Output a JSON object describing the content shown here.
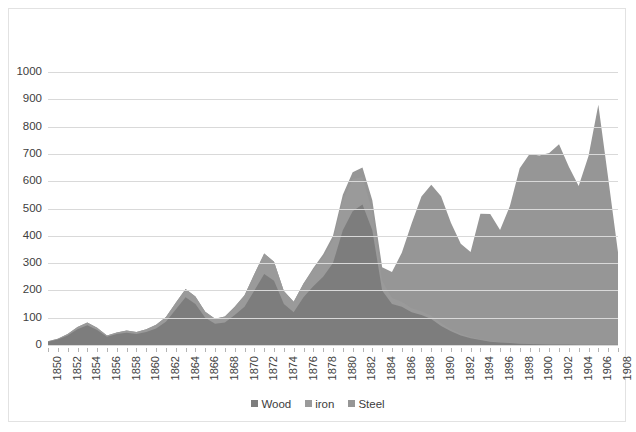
{
  "chart_data": {
    "type": "area",
    "title": "",
    "subtitle": "",
    "xlabel": "",
    "ylabel": "",
    "stacked": true,
    "grid": true,
    "legend_position": "bottom",
    "xlim": [
      1850,
      1908
    ],
    "ylim": [
      0,
      1000
    ],
    "ytick_step": 100,
    "xtick_step": 2,
    "categories": [
      1850,
      1851,
      1852,
      1853,
      1854,
      1855,
      1856,
      1857,
      1858,
      1859,
      1860,
      1861,
      1862,
      1863,
      1864,
      1865,
      1866,
      1867,
      1868,
      1869,
      1870,
      1871,
      1872,
      1873,
      1874,
      1875,
      1876,
      1877,
      1878,
      1879,
      1880,
      1881,
      1882,
      1883,
      1884,
      1885,
      1886,
      1887,
      1888,
      1889,
      1890,
      1891,
      1892,
      1893,
      1894,
      1895,
      1896,
      1897,
      1898,
      1899,
      1900,
      1901,
      1902,
      1903,
      1904,
      1905,
      1906,
      1907,
      1908
    ],
    "ytick_labels": [
      "0",
      "100",
      "200",
      "300",
      "400",
      "500",
      "600",
      "700",
      "800",
      "900",
      "1000"
    ],
    "xtick_labels": [
      "1850",
      "1852",
      "1854",
      "1856",
      "1858",
      "1860",
      "1862",
      "1864",
      "1866",
      "1868",
      "1870",
      "1872",
      "1874",
      "1876",
      "1878",
      "1880",
      "1882",
      "1884",
      "1886",
      "1888",
      "1890",
      "1892",
      "1894",
      "1896",
      "1898",
      "1900",
      "1902",
      "1904",
      "1906",
      "1908"
    ],
    "series": [
      {
        "name": "Wood",
        "color": "#7d7d7d",
        "values": [
          12,
          20,
          35,
          58,
          72,
          55,
          30,
          40,
          45,
          40,
          48,
          60,
          85,
          130,
          175,
          150,
          100,
          78,
          82,
          110,
          140,
          200,
          260,
          235,
          150,
          120,
          175,
          215,
          250,
          300,
          420,
          490,
          515,
          420,
          200,
          150,
          140,
          120,
          110,
          95,
          70,
          50,
          35,
          25,
          18,
          12,
          9,
          7,
          5,
          4,
          3,
          2,
          2,
          2,
          1,
          1,
          1,
          1,
          1
        ]
      },
      {
        "name": "iron",
        "color": "#9a9a9a",
        "values": [
          2,
          3,
          5,
          8,
          10,
          8,
          5,
          6,
          8,
          8,
          10,
          14,
          18,
          25,
          30,
          28,
          22,
          18,
          22,
          30,
          42,
          60,
          75,
          70,
          48,
          38,
          50,
          62,
          72,
          85,
          110,
          118,
          100,
          70,
          35,
          22,
          18,
          15,
          14,
          12,
          10,
          8,
          6,
          4,
          3,
          3,
          2,
          2,
          2,
          1,
          1,
          1,
          1,
          1,
          1,
          1,
          1,
          1,
          1
        ]
      },
      {
        "name": "Steel",
        "color": "#969696",
        "values": [
          0,
          0,
          0,
          0,
          0,
          0,
          0,
          0,
          0,
          0,
          0,
          0,
          0,
          0,
          0,
          0,
          0,
          0,
          0,
          0,
          0,
          0,
          0,
          0,
          0,
          0,
          0,
          5,
          10,
          15,
          20,
          25,
          35,
          40,
          50,
          95,
          180,
          310,
          420,
          480,
          465,
          390,
          330,
          312,
          460,
          465,
          410,
          500,
          640,
          695,
          690,
          700,
          732,
          650,
          580,
          690,
          878,
          610,
          338
        ]
      }
    ]
  },
  "legend": {
    "items": [
      {
        "label": "Wood",
        "color": "#7d7d7d"
      },
      {
        "label": "iron",
        "color": "#9a9a9a"
      },
      {
        "label": "Steel",
        "color": "#969696"
      }
    ]
  }
}
